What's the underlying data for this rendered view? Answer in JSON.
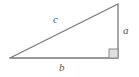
{
  "figure": {
    "background_color": "#ffffff",
    "stroke_color": "#7a7a7a",
    "label_color": "#555555",
    "right_angle_fill": "#e0e0e0",
    "right_angle_stroke": "#8a8a8a"
  },
  "geometry": {
    "vertices": {
      "left": {
        "x": 10,
        "y": 58
      },
      "bottom_right": {
        "x": 118,
        "y": 58
      },
      "top_right": {
        "x": 118,
        "y": 4
      }
    },
    "right_angle_marker": {
      "x": 109,
      "y": 49,
      "size": 9
    },
    "stroke_width": 1.3
  },
  "labels": {
    "hypotenuse": "c",
    "vertical_leg": "a",
    "horizontal_leg": "b"
  }
}
